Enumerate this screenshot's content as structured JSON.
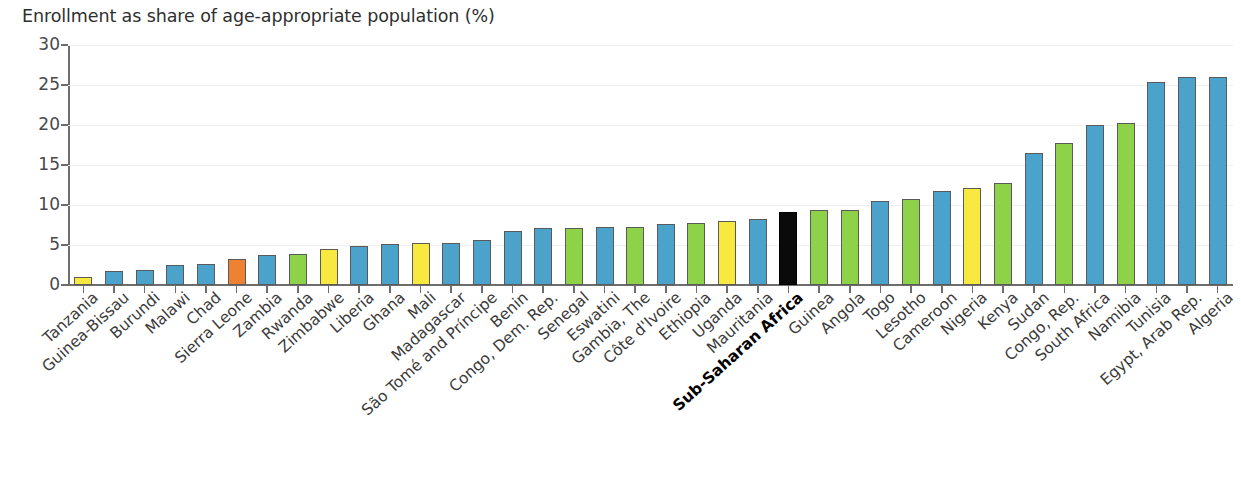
{
  "chart_data": {
    "type": "bar",
    "title": "Enrollment as share of age-appropriate population (%)",
    "xlabel": "",
    "ylabel": "",
    "ylim": [
      0,
      30
    ],
    "yticks": [
      0,
      5,
      10,
      15,
      20,
      25,
      30
    ],
    "ytick_labels": [
      "0",
      "5",
      "10",
      "15",
      "20",
      "25",
      "30"
    ],
    "grid": false,
    "legend": "none",
    "highlight_category": "Sub-Saharan Africa",
    "colors": {
      "blue": "#4ba3cc",
      "green": "#8ed24a",
      "yellow": "#f7e93f",
      "orange": "#ef8133",
      "black": "#0a0a0a",
      "bar_outline": "#5a5a5a",
      "axis": "#6d6d6d",
      "text": "#3b3b3b"
    },
    "categories": [
      "Tanzania",
      "Guinea-Bissau",
      "Burundi",
      "Malawi",
      "Chad",
      "Sierra Leone",
      "Zambia",
      "Rwanda",
      "Zimbabwe",
      "Liberia",
      "Ghana",
      "Mali",
      "Madagascar",
      "São Tomé and Príncipe",
      "Benin",
      "Congo, Dem. Rep.",
      "Senegal",
      "Eswatini",
      "Gambia, The",
      "Côte d'Ivoire",
      "Ethiopia",
      "Uganda",
      "Mauritania",
      "Sub-Saharan Africa",
      "Guinea",
      "Angola",
      "Togo",
      "Lesotho",
      "Cameroon",
      "Nigeria",
      "Kenya",
      "Sudan",
      "Congo, Rep.",
      "South Africa",
      "Namibia",
      "Tunisia",
      "Egypt, Arab Rep.",
      "Algeria"
    ],
    "values": [
      1.0,
      1.8,
      1.9,
      2.5,
      2.6,
      3.2,
      3.8,
      3.9,
      4.5,
      4.9,
      5.1,
      5.2,
      5.3,
      5.6,
      6.7,
      7.1,
      7.1,
      7.2,
      7.3,
      7.6,
      7.8,
      8.0,
      8.2,
      9.1,
      9.4,
      9.4,
      10.5,
      10.8,
      11.7,
      12.1,
      12.8,
      16.5,
      17.8,
      20.0,
      20.2,
      25.4,
      26.0,
      26.0
    ],
    "bar_colors": [
      "yellow",
      "blue",
      "blue",
      "blue",
      "blue",
      "orange",
      "blue",
      "green",
      "yellow",
      "blue",
      "blue",
      "yellow",
      "blue",
      "blue",
      "blue",
      "blue",
      "green",
      "blue",
      "green",
      "blue",
      "green",
      "yellow",
      "blue",
      "black",
      "green",
      "green",
      "blue",
      "green",
      "blue",
      "yellow",
      "green",
      "blue",
      "green",
      "blue",
      "green",
      "blue",
      "blue",
      "blue"
    ]
  }
}
